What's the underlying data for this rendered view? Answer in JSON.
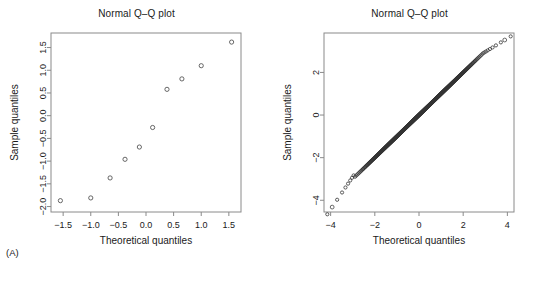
{
  "figure": {
    "width": 546,
    "height": 289,
    "background": "#ffffff",
    "point_color": "#4d4d4d",
    "axis_color": "#8a8a8a",
    "text_color": "#1a1a1a"
  },
  "panels": [
    {
      "key": "A",
      "caption": "(A)",
      "title": "Normal Q–Q plot",
      "xlabel": "Theoretical quantiles",
      "ylabel": "Sample quantiles"
    },
    {
      "key": "B",
      "caption": "(B)",
      "title": "Normal Q–Q plot",
      "xlabel": "Theoretical quantiles",
      "ylabel": "Sample quantiles"
    }
  ],
  "chart_data": [
    {
      "type": "scatter",
      "panel": "A",
      "title": "Normal Q–Q plot",
      "xlabel": "Theoretical quantiles",
      "ylabel": "Sample quantiles",
      "xticks": [
        -1.5,
        -1.0,
        -0.5,
        0.0,
        0.5,
        1.0,
        1.5
      ],
      "yticks": [
        -2.0,
        -1.5,
        -1.0,
        -0.5,
        0.0,
        0.5,
        1.0,
        1.5
      ],
      "xticklabels": [
        "-1.5",
        "-1.0",
        "-0.5",
        "0.0",
        "0.5",
        "1.0",
        "1.5"
      ],
      "yticklabels": [
        "-2.0",
        "-1.5",
        "-1.0",
        "-0.5",
        "0.0",
        "0.5",
        "1.0",
        "1.5"
      ],
      "xlim": [
        -1.72,
        1.72
      ],
      "ylim": [
        -2.12,
        1.82
      ],
      "grid": false,
      "legend": null,
      "marker": "open-circle",
      "n": 10,
      "x": [
        -1.55,
        -1.0,
        -0.65,
        -0.38,
        -0.12,
        0.12,
        0.38,
        0.65,
        1.0,
        1.55
      ],
      "y": [
        -1.87,
        -1.81,
        -1.37,
        -0.96,
        -0.69,
        -0.26,
        0.58,
        0.81,
        1.1,
        1.62
      ],
      "points": [
        {
          "x": -1.55,
          "y": -1.87
        },
        {
          "x": -1.0,
          "y": -1.81
        },
        {
          "x": -0.65,
          "y": -1.37
        },
        {
          "x": -0.38,
          "y": -0.96
        },
        {
          "x": -0.12,
          "y": -0.69
        },
        {
          "x": 0.12,
          "y": -0.26
        },
        {
          "x": 0.38,
          "y": 0.58
        },
        {
          "x": 0.65,
          "y": 0.81
        },
        {
          "x": 1.0,
          "y": 1.1
        },
        {
          "x": 1.55,
          "y": 1.62
        }
      ]
    },
    {
      "type": "scatter",
      "panel": "B",
      "title": "Normal Q–Q plot",
      "xlabel": "Theoretical quantiles",
      "ylabel": "Sample quantiles",
      "xticks": [
        -4,
        -2,
        0,
        2,
        4
      ],
      "yticks": [
        -4,
        -2,
        0,
        2
      ],
      "xticklabels": [
        "-4",
        "-2",
        "0",
        "2",
        "4"
      ],
      "yticklabels": [
        "-4",
        "-2",
        "0",
        "2"
      ],
      "xlim": [
        -4.3,
        4.3
      ],
      "ylim": [
        -4.55,
        3.85
      ],
      "grid": false,
      "legend": null,
      "marker": "open-circle",
      "n": 600,
      "description": "Dense near-linear band of sample quantiles versus theoretical quantiles; slight flattening in the lower tail below about -3.",
      "reference_line": {
        "slope": 1.0,
        "intercept": 0.0
      },
      "lower_tail_kink_x": -2.95,
      "lower_tail_kink_y": -2.82,
      "extreme_low": {
        "x": -3.93,
        "y": -4.32
      },
      "extreme_high": {
        "x": 3.88,
        "y": 3.52
      }
    }
  ]
}
